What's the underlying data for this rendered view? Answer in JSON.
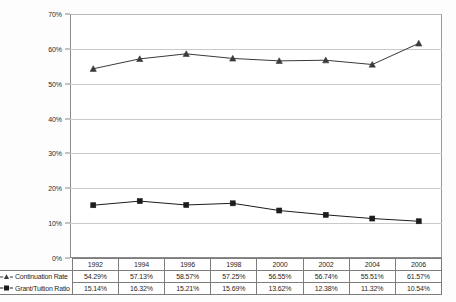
{
  "chart_data": {
    "type": "line",
    "title": "",
    "subtitle": "",
    "xlabel": "",
    "ylabel": "",
    "categories": [
      "1992",
      "1994",
      "1996",
      "1998",
      "2000",
      "2002",
      "2004",
      "2006"
    ],
    "ylim": [
      0,
      70
    ],
    "ytick_labels": [
      "0%",
      "10%",
      "20%",
      "30%",
      "40%",
      "50%",
      "60%",
      "70%"
    ],
    "ytick_values": [
      0,
      10,
      20,
      30,
      40,
      50,
      60,
      70
    ],
    "grid": true,
    "legend_position": "left-table",
    "series": [
      {
        "name": "Continuation Rate",
        "marker": "triangle",
        "color": "#3a3a3a",
        "values": [
          54.29,
          57.13,
          58.57,
          57.25,
          56.55,
          56.74,
          55.51,
          61.57
        ],
        "labels": [
          "54.29%",
          "57.13%",
          "58.57%",
          "57.25%",
          "56.55%",
          "56.74%",
          "55.51%",
          "61.57%"
        ]
      },
      {
        "name": "Grant/Tuition Ratio",
        "marker": "square",
        "color": "#1c1c1c",
        "values": [
          15.14,
          16.32,
          15.21,
          15.69,
          13.62,
          12.38,
          11.32,
          10.54
        ],
        "labels": [
          "15.14%",
          "16.32%",
          "15.21%",
          "15.69%",
          "13.62%",
          "12.38%",
          "11.32%",
          "10.54%"
        ]
      }
    ]
  },
  "table": {
    "header_row": [
      "1992",
      "1994",
      "1996",
      "1998",
      "2000",
      "2002",
      "2004",
      "2006"
    ],
    "rows": [
      {
        "label": "Continuation Rate",
        "marker_icon": "triangle-marker-icon",
        "cells": [
          "54.29%",
          "57.13%",
          "58.57%",
          "57.25%",
          "56.55%",
          "56.74%",
          "55.51%",
          "61.57%"
        ]
      },
      {
        "label": "Grant/Tuition Ratio",
        "marker_icon": "square-marker-icon",
        "cells": [
          "15.14%",
          "16.32%",
          "15.21%",
          "15.69%",
          "13.62%",
          "12.38%",
          "11.32%",
          "10.54%"
        ]
      }
    ]
  },
  "colors": {
    "plot_background": "#ffffff",
    "gridline": "#c9c9c9",
    "axis": "#8a8a8a",
    "series_1": "#3a3a3a",
    "series_2": "#1c1c1c",
    "table_border": "#7d7d7d"
  }
}
